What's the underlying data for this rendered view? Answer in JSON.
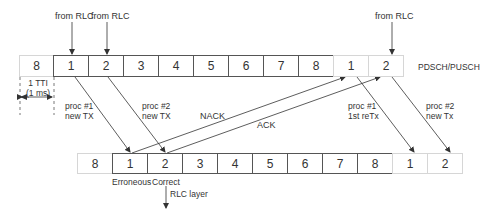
{
  "diagram": {
    "top_row": {
      "label": "PDSCH/PUSCH",
      "cells": [
        {
          "label": "8",
          "faded": true
        },
        {
          "label": "1",
          "faded": false
        },
        {
          "label": "2",
          "faded": false
        },
        {
          "label": "3",
          "faded": false
        },
        {
          "label": "4",
          "faded": false
        },
        {
          "label": "5",
          "faded": false
        },
        {
          "label": "6",
          "faded": false
        },
        {
          "label": "7",
          "faded": false
        },
        {
          "label": "8",
          "faded": false
        },
        {
          "label": "1",
          "faded": true
        },
        {
          "label": "2",
          "faded": true
        }
      ]
    },
    "bottom_row": {
      "cells": [
        {
          "label": "8",
          "faded": true
        },
        {
          "label": "1",
          "faded": false
        },
        {
          "label": "2",
          "faded": false
        },
        {
          "label": "3",
          "faded": false
        },
        {
          "label": "4",
          "faded": false
        },
        {
          "label": "5",
          "faded": false
        },
        {
          "label": "6",
          "faded": false
        },
        {
          "label": "7",
          "faded": false
        },
        {
          "label": "8",
          "faded": false
        },
        {
          "label": "1",
          "faded": true
        },
        {
          "label": "2",
          "faded": true
        }
      ]
    },
    "labels": {
      "from_rlc_1": "from RLC",
      "from_rlc_2": "from RLC",
      "from_rlc_3": "from RLC",
      "tti_line1": "1 TTI",
      "tti_line2": "(1 ms)",
      "proc1_new_l1": "proc #1",
      "proc1_new_l2": "new TX",
      "proc2_new_l1": "proc #2",
      "proc2_new_l2": "new TX",
      "nack": "NACK",
      "ack": "ACK",
      "proc1_retx_l1": "proc #1",
      "proc1_retx_l2": "1st reTx",
      "proc2_newtx_l1": "proc #2",
      "proc2_newtx_l2": "new Tx",
      "erroneous": "Erroneous",
      "correct": "Correct",
      "rlc_layer": "RLC layer"
    },
    "colors": {
      "line": "#333333",
      "border": "#555555",
      "faded_border": "#d6d6d6"
    }
  }
}
